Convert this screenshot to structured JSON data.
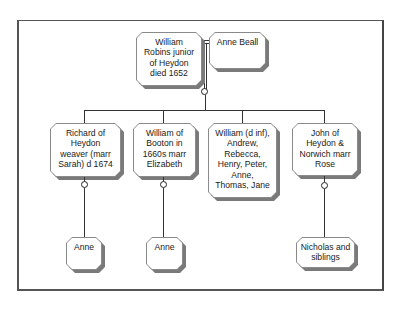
{
  "diagram": {
    "type": "family-tree",
    "root": {
      "label": "William\nRobins junior\nof Heydon\ndied 1652",
      "spouse": "Anne Beall"
    },
    "children": [
      {
        "label": "Richard of\nHeydon\nweaver (marr\nSarah) d 1674",
        "descendants": "Anne"
      },
      {
        "label": "William of\nBooton in\n1660s marr\nElizabeth",
        "descendants": "Anne"
      },
      {
        "label": "William (d inf),\nAndrew,\nRebecca,\nHenry, Peter,\nAnne,\nThomas, Jane",
        "descendants": null
      },
      {
        "label": "John of\nHeydon &\nNorwich marr\nRose",
        "descendants": "Nicholas and\nsiblings"
      }
    ]
  },
  "colors": {
    "line": "#333333",
    "shadow": "#7a7a7a",
    "box_fill": "#ffffff",
    "text": "#1a1a1a"
  }
}
